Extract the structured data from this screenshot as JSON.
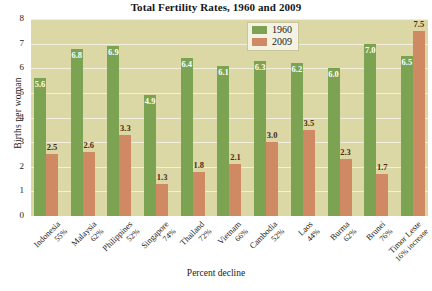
{
  "chart_data": {
    "type": "bar",
    "title": "Total Fertility Rates, 1960 and 2009",
    "xlabel": "Percent decline",
    "ylabel": "Births per woman",
    "ylim": [
      0,
      8
    ],
    "yticks": [
      "0",
      "1",
      "2",
      "3",
      "4",
      "5",
      "6",
      "7",
      "8"
    ],
    "grid": true,
    "legend_position": "top-right",
    "categories": [
      "Indonesia",
      "Malaysia",
      "Philippines",
      "Singapore",
      "Thailand",
      "Vietnam",
      "Cambodia",
      "Laos",
      "Burma",
      "Brunei",
      "Timor Leste"
    ],
    "category_sublabels": [
      "55%",
      "62%",
      "52%",
      "74%",
      "72%",
      "66%",
      "52%",
      "44%",
      "62%",
      "76%",
      "16% increase"
    ],
    "series": [
      {
        "name": "1960",
        "color": "#7ba352",
        "values": [
          5.6,
          6.8,
          6.9,
          4.9,
          6.4,
          6.1,
          6.3,
          6.2,
          6.0,
          7.0,
          6.5
        ]
      },
      {
        "name": "2009",
        "color": "#d08a63",
        "values": [
          2.5,
          2.6,
          3.3,
          1.3,
          1.8,
          2.1,
          3.0,
          3.5,
          2.3,
          1.7,
          7.5
        ]
      }
    ]
  },
  "colors": {
    "plot_background": "#dcd8a6",
    "gridline": "#f2f0dc",
    "series_1960": "#7ba352",
    "series_2009": "#d08a63",
    "label_on_green": "#ffffff",
    "label_on_salmon": "#4a2a14",
    "legend_background": "#f4f2e2"
  }
}
